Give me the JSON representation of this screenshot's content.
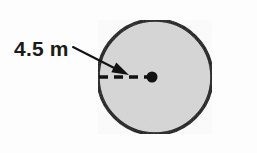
{
  "figure": {
    "type": "geometry-diagram",
    "background_color": "#fdfdfd"
  },
  "circle": {
    "name": "shaded-circle",
    "fill_color": "#d6d6d6",
    "stroke_color": "#111111",
    "stroke_width": 3.5,
    "center_x": 155,
    "center_y": 77,
    "radius": 57
  },
  "center_point": {
    "name": "center-dot",
    "color": "#111111",
    "x": 152,
    "y": 77,
    "radius": 5.5
  },
  "radius_line": {
    "name": "radius-dashed-line",
    "color": "#111111",
    "stroke_width": 3.5,
    "dash_pattern": "9 6",
    "x1": 99,
    "y1": 77,
    "x2": 152,
    "y2": 77
  },
  "leader": {
    "name": "leader-arrow",
    "color": "#111111",
    "stroke_width": 2,
    "x1": 73,
    "y1": 47,
    "x2": 124,
    "y2": 73,
    "arrow_tip_x": 129,
    "arrow_tip_y": 75
  },
  "measurement": {
    "label": "4.5 m",
    "value": 4.5,
    "unit": "m",
    "quantity": "radius",
    "text_x": 14,
    "text_y": 56,
    "color": "#1b1b1b"
  }
}
